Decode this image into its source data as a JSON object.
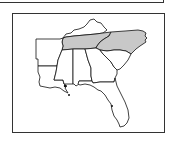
{
  "map": {
    "region": "Southeastern United States",
    "highlight_color": "#c8c8c8",
    "base_color": "#ffffff",
    "stroke_color": "#111111",
    "states": [
      {
        "name": "Kentucky",
        "highlighted": false
      },
      {
        "name": "Tennessee",
        "highlighted": true
      },
      {
        "name": "North Carolina",
        "highlighted": true
      },
      {
        "name": "Arkansas",
        "highlighted": false
      },
      {
        "name": "Louisiana",
        "highlighted": false
      },
      {
        "name": "Mississippi",
        "highlighted": false
      },
      {
        "name": "Alabama",
        "highlighted": false
      },
      {
        "name": "Georgia",
        "highlighted": false
      },
      {
        "name": "South Carolina",
        "highlighted": false
      },
      {
        "name": "Florida",
        "highlighted": false
      }
    ]
  }
}
